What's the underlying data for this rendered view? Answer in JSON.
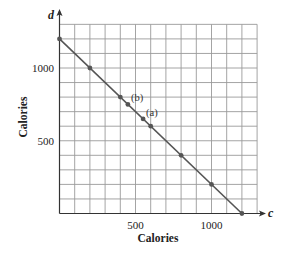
{
  "chart_data": {
    "type": "line",
    "title": "",
    "xlabel": "Calories",
    "ylabel": "Calories",
    "x_variable": "c",
    "y_variable": "d",
    "xlim": [
      0,
      1300
    ],
    "ylim": [
      0,
      1300
    ],
    "grid": true,
    "grid_step": 100,
    "x_ticks": [
      {
        "value": 500,
        "label": "500"
      },
      {
        "value": 1000,
        "label": "1000"
      }
    ],
    "y_ticks": [
      {
        "value": 500,
        "label": "500"
      },
      {
        "value": 1000,
        "label": "1000"
      }
    ],
    "series": [
      {
        "name": "c + d = 1200",
        "x": [
          0,
          1200
        ],
        "y": [
          1200,
          0
        ],
        "color": "#555555"
      }
    ],
    "points": [
      {
        "x": 0,
        "y": 1200
      },
      {
        "x": 200,
        "y": 1000
      },
      {
        "x": 400,
        "y": 800
      },
      {
        "x": 450,
        "y": 750,
        "label": "(b)"
      },
      {
        "x": 550,
        "y": 650,
        "label": "(a)"
      },
      {
        "x": 600,
        "y": 600
      },
      {
        "x": 800,
        "y": 400
      },
      {
        "x": 1000,
        "y": 200
      },
      {
        "x": 1200,
        "y": 0
      }
    ],
    "annotations": [
      {
        "text": "(b)",
        "x": 450,
        "y": 750
      },
      {
        "text": "(a)",
        "x": 550,
        "y": 650
      }
    ]
  },
  "colors": {
    "grid": "#9a9a9a",
    "axis": "#333333",
    "line": "#555555",
    "point": "#555555"
  }
}
